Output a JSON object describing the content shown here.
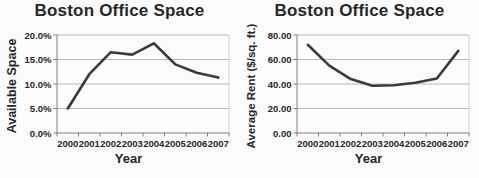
{
  "figure": {
    "background_color": "#fdfdfd",
    "text_color": "#262626",
    "series_line_color": "#3a3a3a",
    "gridline_color": "#b8b8b8",
    "axis_line_color": "#7f7f7f",
    "plot_border_color": "#cfcfcf"
  },
  "chart_data": [
    {
      "type": "line",
      "title": "Boston Office Space",
      "xlabel": "Year",
      "ylabel": "Available Space",
      "categories": [
        "2000",
        "2001",
        "2002",
        "2003",
        "2004",
        "2005",
        "2006",
        "2007"
      ],
      "values": [
        5.0,
        12.0,
        16.5,
        16.0,
        18.3,
        14.0,
        12.3,
        11.3
      ],
      "ylim": [
        0,
        20
      ],
      "yticks": [
        {
          "value": 0,
          "label": "0.0%"
        },
        {
          "value": 5,
          "label": "5.0%"
        },
        {
          "value": 10,
          "label": "10.0%"
        },
        {
          "value": 15,
          "label": "15.0%"
        },
        {
          "value": 20,
          "label": "20.0%"
        }
      ],
      "grid": true,
      "legend": "none"
    },
    {
      "type": "line",
      "title": "Boston Office Space",
      "xlabel": "Year",
      "ylabel": "Average Rent ($/sq. ft.)",
      "categories": [
        "2000",
        "2001",
        "2002",
        "2003",
        "2004",
        "2005",
        "2006",
        "2007"
      ],
      "values": [
        72.0,
        55.0,
        44.0,
        38.5,
        39.0,
        41.0,
        44.5,
        67.0
      ],
      "ylim": [
        0,
        80
      ],
      "yticks": [
        {
          "value": 0,
          "label": "0.00"
        },
        {
          "value": 20,
          "label": "20.00"
        },
        {
          "value": 40,
          "label": "40.00"
        },
        {
          "value": 60,
          "label": "60.00"
        },
        {
          "value": 80,
          "label": "80.00"
        }
      ],
      "grid": true,
      "legend": "none"
    }
  ]
}
